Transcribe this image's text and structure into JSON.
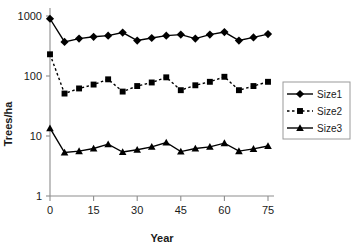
{
  "chart_data": {
    "type": "line",
    "title": "",
    "xlabel": "Year",
    "ylabel": "Trees/ha",
    "xlim": [
      0,
      75
    ],
    "ylim": [
      1,
      1000
    ],
    "yscale": "log",
    "xticks": [
      0,
      15,
      30,
      45,
      60,
      75
    ],
    "xtick_labels": [
      "0",
      "15",
      "30",
      "45",
      "60",
      "75"
    ],
    "yticks": [
      1,
      10,
      100,
      1000
    ],
    "ytick_labels": [
      "1",
      "10",
      "100",
      "1000"
    ],
    "grid": false,
    "legend_position": "right",
    "x": [
      0,
      5,
      10,
      15,
      20,
      25,
      30,
      35,
      40,
      45,
      50,
      55,
      60,
      65,
      70,
      75
    ],
    "series": [
      {
        "name": "Size1",
        "marker": "diamond",
        "linestyle": "solid",
        "color": "#000000",
        "values": [
          900,
          370,
          420,
          450,
          470,
          530,
          390,
          430,
          470,
          490,
          420,
          490,
          540,
          390,
          440,
          500
        ]
      },
      {
        "name": "Size2",
        "marker": "square",
        "linestyle": "dashed",
        "color": "#000000",
        "values": [
          230,
          51,
          62,
          72,
          88,
          55,
          68,
          78,
          95,
          58,
          70,
          80,
          97,
          58,
          68,
          80
        ]
      },
      {
        "name": "Size3",
        "marker": "triangle",
        "linestyle": "solid",
        "color": "#000000",
        "values": [
          13.5,
          5.3,
          5.6,
          6.2,
          7.3,
          5.4,
          5.9,
          6.6,
          7.8,
          5.5,
          6.2,
          6.6,
          7.6,
          5.6,
          6.1,
          6.8
        ]
      }
    ]
  },
  "legend": {
    "entries": [
      {
        "label": "Size1"
      },
      {
        "label": "Size2"
      },
      {
        "label": "Size3"
      }
    ]
  },
  "axes": {
    "x_axis_title": "Year",
    "y_axis_title": "Trees/ha"
  }
}
